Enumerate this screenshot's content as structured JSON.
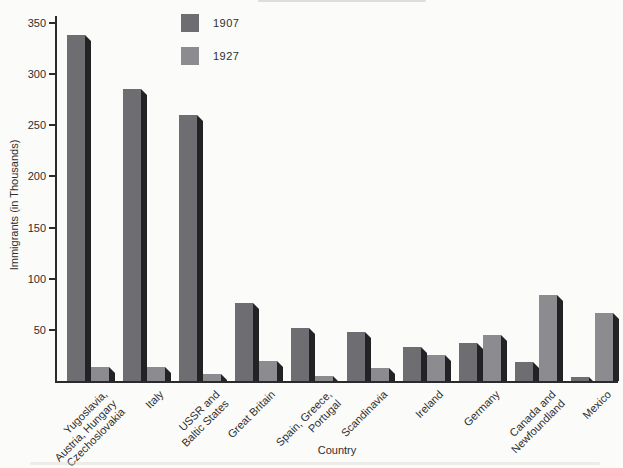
{
  "chart_data": {
    "type": "bar",
    "title": "",
    "xlabel": "Country",
    "ylabel": "Immigrants (in Thousands)",
    "ylim": [
      0,
      350
    ],
    "yticks": [
      50,
      100,
      150,
      200,
      250,
      300,
      350
    ],
    "grid": false,
    "legend_position": "top-inside-left",
    "bar_style": "3d-drop-shadow",
    "categories": [
      "Yugoslavia,\nAustria, Hungary\nCzechoslovakia",
      "Italy",
      "USSR and\nBaltic States",
      "Great Britain",
      "Spain, Greece,\nPortugal",
      "Scandinavia",
      "Ireland",
      "Germany",
      "Canada and\nNewfoundland",
      "Mexico"
    ],
    "series": [
      {
        "name": "1907",
        "color": "#6e6e72",
        "values": [
          338,
          285,
          260,
          76,
          52,
          48,
          33,
          37,
          19,
          4
        ]
      },
      {
        "name": "1927",
        "color": "#8c8c90",
        "values": [
          14,
          14,
          7,
          20,
          5,
          13,
          25,
          45,
          84,
          66
        ]
      }
    ],
    "shadow_color": "#232326",
    "axis_color": "#2b2b2b",
    "text_color": "#2e2e2e",
    "background_color": "#fbfbf9"
  }
}
